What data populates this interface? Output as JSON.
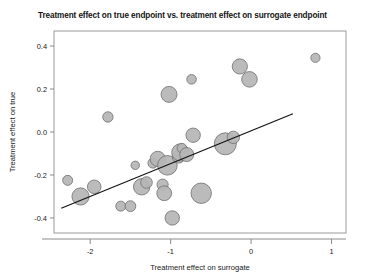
{
  "chart_data": {
    "type": "scatter",
    "title": "Treatment effect on true endpoint vs. treatment effect on surrogate endpoint",
    "xlabel": "Treatment effect on surrogate",
    "ylabel": "Treatment effect on true",
    "xlim": [
      -2.45,
      1.18
    ],
    "ylim": [
      -0.47,
      0.47
    ],
    "xticks": [
      -2,
      -1,
      0,
      1
    ],
    "xtick_labels": [
      "-2",
      "-1",
      "0",
      "1"
    ],
    "yticks": [
      0.4,
      0.2,
      0.0,
      -0.2,
      -0.4
    ],
    "ytick_labels": [
      "0.4",
      "0.2",
      "0.0",
      "-0.2",
      "-0.4"
    ],
    "grid": false,
    "legend": null,
    "marker": "bubble",
    "bubble_size_meaning": "study weight",
    "points": [
      {
        "x": -2.28,
        "y": -0.225,
        "size": 5.0
      },
      {
        "x": -2.12,
        "y": -0.3,
        "size": 8.6
      },
      {
        "x": -1.95,
        "y": -0.255,
        "size": 6.8
      },
      {
        "x": -1.78,
        "y": 0.07,
        "size": 5.2
      },
      {
        "x": -1.62,
        "y": -0.345,
        "size": 5.0
      },
      {
        "x": -1.5,
        "y": -0.345,
        "size": 5.4
      },
      {
        "x": -1.44,
        "y": -0.155,
        "size": 4.2
      },
      {
        "x": -1.36,
        "y": -0.255,
        "size": 8.2
      },
      {
        "x": -1.3,
        "y": -0.235,
        "size": 5.8
      },
      {
        "x": -1.22,
        "y": -0.145,
        "size": 5.0
      },
      {
        "x": -1.16,
        "y": -0.125,
        "size": 7.6
      },
      {
        "x": -1.1,
        "y": -0.245,
        "size": 5.6
      },
      {
        "x": -1.08,
        "y": -0.285,
        "size": 7.4
      },
      {
        "x": -1.04,
        "y": -0.155,
        "size": 9.8
      },
      {
        "x": -1.02,
        "y": 0.175,
        "size": 8.0
      },
      {
        "x": -0.98,
        "y": -0.4,
        "size": 7.2
      },
      {
        "x": -0.9,
        "y": -0.115,
        "size": 6.4
      },
      {
        "x": -0.88,
        "y": -0.095,
        "size": 8.6
      },
      {
        "x": -0.86,
        "y": -0.075,
        "size": 4.8
      },
      {
        "x": -0.8,
        "y": -0.105,
        "size": 7.0
      },
      {
        "x": -0.74,
        "y": 0.245,
        "size": 4.8
      },
      {
        "x": -0.72,
        "y": -0.015,
        "size": 7.2
      },
      {
        "x": -0.62,
        "y": -0.285,
        "size": 10.2
      },
      {
        "x": -0.32,
        "y": -0.055,
        "size": 11.0
      },
      {
        "x": -0.22,
        "y": -0.025,
        "size": 6.2
      },
      {
        "x": -0.14,
        "y": 0.305,
        "size": 7.6
      },
      {
        "x": -0.02,
        "y": 0.245,
        "size": 7.8
      },
      {
        "x": 0.8,
        "y": 0.345,
        "size": 4.6
      }
    ],
    "trend_line": {
      "x0": -2.36,
      "y0": -0.355,
      "x1": 0.52,
      "y1": 0.085
    }
  }
}
